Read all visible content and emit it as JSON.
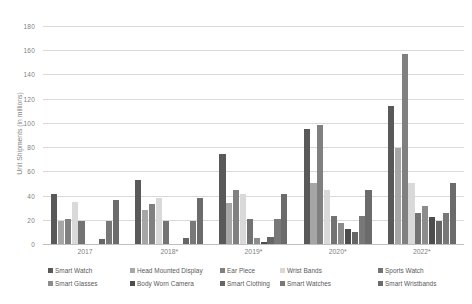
{
  "chart_data": {
    "type": "bar",
    "title": "",
    "subtitle": "",
    "xlabel": "",
    "ylabel": "Unit Shipments (in millions)",
    "ylim": [
      0,
      180
    ],
    "ytick_step": 20,
    "yticks": [
      0,
      20,
      40,
      60,
      80,
      100,
      120,
      140,
      160,
      180
    ],
    "grid": true,
    "legend_position": "bottom",
    "categories": [
      "2017",
      "2018*",
      "2019*",
      "2020*",
      "2022*"
    ],
    "series": [
      {
        "name": "Smart Watch",
        "color": "#595959",
        "values": [
          41,
          53,
          74,
          95,
          114
        ]
      },
      {
        "name": "Head Mounted Display",
        "color": "#a6a6a6",
        "values": [
          19,
          28,
          34,
          50,
          79
        ]
      },
      {
        "name": "Ear Piece",
        "color": "#808080",
        "values": [
          21,
          33,
          45,
          98,
          157
        ]
      },
      {
        "name": "Wrist Bands",
        "color": "#d9d9d9",
        "values": [
          35,
          38,
          41,
          45,
          50
        ]
      },
      {
        "name": "Sports Watch",
        "color": "#737373",
        "values": [
          19,
          19,
          21,
          23,
          26
        ]
      },
      {
        "name": "Smart Glasses",
        "color": "#8c8c8c",
        "values": [
          0,
          0,
          5,
          17,
          31
        ]
      },
      {
        "name": "Body Worn Camera",
        "color": "#4d4d4d",
        "values": [
          0,
          0,
          2,
          12,
          22
        ]
      },
      {
        "name": "Smart Clothing",
        "color": "#666666",
        "values": [
          4,
          5,
          6,
          10,
          19
        ]
      },
      {
        "name": "Smart Watches",
        "color": "#787878",
        "values": [
          19,
          19,
          21,
          23,
          26
        ]
      },
      {
        "name": "Smart Wristbands",
        "color": "#6b6b6b",
        "values": [
          36,
          38,
          41,
          45,
          50
        ]
      }
    ]
  },
  "axis": {
    "y_title": "Unit Shipments (in millions)",
    "y_labels": [
      "0",
      "20",
      "40",
      "60",
      "80",
      "100",
      "120",
      "140",
      "160",
      "180"
    ],
    "x_labels": [
      "2017",
      "2018*",
      "2019*",
      "2020*",
      "2022*"
    ]
  },
  "legend": {
    "items": [
      {
        "label": "Smart Watch"
      },
      {
        "label": "Head Mounted Display"
      },
      {
        "label": "Ear Piece"
      },
      {
        "label": "Wrist Bands"
      },
      {
        "label": "Sports Watch"
      },
      {
        "label": "Smart Glasses"
      },
      {
        "label": "Body Worn Camera"
      },
      {
        "label": "Smart Clothing"
      },
      {
        "label": "Smart Watches"
      },
      {
        "label": "Smart Wristbands"
      }
    ]
  }
}
